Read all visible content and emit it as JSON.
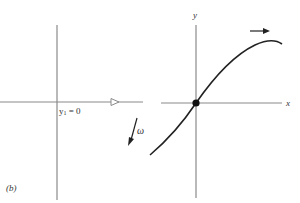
{
  "figure": {
    "panel_label": "(b)",
    "left_panel": {
      "line_label_main": "y",
      "line_label_sub": "1",
      "line_label_rest": " = 0",
      "rotation_label": "ω",
      "axis_color": "#8a8a8a"
    },
    "right_panel": {
      "x_axis_label": "x",
      "y_axis_label": "y",
      "curve_color": "#222222",
      "axis_color": "#8a8a8a",
      "origin_marker": "filled-dot"
    }
  }
}
